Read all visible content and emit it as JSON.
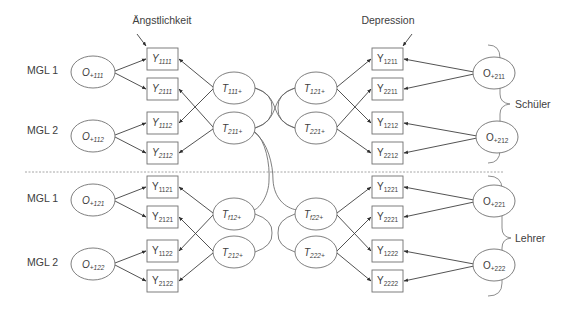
{
  "headings": {
    "left_construct": "Ängstlichkeit",
    "right_construct": "Depression"
  },
  "row_labels": {
    "mgl1_upper": "MGL 1",
    "mgl2_upper": "MGL 2",
    "mgl1_lower": "MGL 1",
    "mgl2_lower": "MGL 2"
  },
  "group_labels": {
    "upper": "Schüler",
    "lower": "Lehrer"
  },
  "method_factors_left": [
    {
      "base": "O",
      "sub": "+111"
    },
    {
      "base": "O",
      "sub": "+112"
    },
    {
      "base": "O",
      "sub": "+121"
    },
    {
      "base": "O",
      "sub": "+122"
    }
  ],
  "method_factors_right": [
    {
      "base": "O",
      "sub": "+211"
    },
    {
      "base": "O",
      "sub": "+212"
    },
    {
      "base": "O",
      "sub": "+221"
    },
    {
      "base": "O",
      "sub": "+222"
    }
  ],
  "indicators_left": [
    {
      "base": "Y",
      "sub": "1111"
    },
    {
      "base": "Y",
      "sub": "2111"
    },
    {
      "base": "Y",
      "sub": "1112"
    },
    {
      "base": "Y",
      "sub": "2112"
    },
    {
      "base": "Y",
      "sub": "1121"
    },
    {
      "base": "Y",
      "sub": "2121"
    },
    {
      "base": "Y",
      "sub": "1122"
    },
    {
      "base": "Y",
      "sub": "2122"
    }
  ],
  "indicators_right": [
    {
      "base": "Y",
      "sub": "1211"
    },
    {
      "base": "Y",
      "sub": "2211"
    },
    {
      "base": "Y",
      "sub": "1212"
    },
    {
      "base": "Y",
      "sub": "2212"
    },
    {
      "base": "Y",
      "sub": "1221"
    },
    {
      "base": "Y",
      "sub": "2221"
    },
    {
      "base": "Y",
      "sub": "1222"
    },
    {
      "base": "Y",
      "sub": "2222"
    }
  ],
  "trait_factors_left": [
    {
      "base": "T",
      "sub": "111+"
    },
    {
      "base": "T",
      "sub": "211+"
    },
    {
      "base": "T",
      "sub": "f12+"
    },
    {
      "base": "T",
      "sub": "212+"
    }
  ],
  "trait_factors_right": [
    {
      "base": "T",
      "sub": "121+"
    },
    {
      "base": "T",
      "sub": "221+"
    },
    {
      "base": "T",
      "sub": "f22+"
    },
    {
      "base": "T",
      "sub": "222+"
    }
  ]
}
